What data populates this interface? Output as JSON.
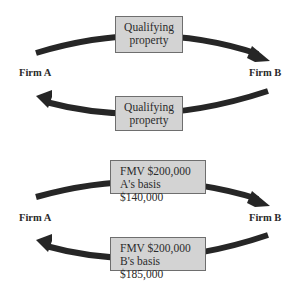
{
  "diagrams": [
    {
      "left_party": "Firm A",
      "right_party": "Firm B",
      "top_box": {
        "lines": [
          "Qualifying",
          "property"
        ]
      },
      "bottom_box": {
        "lines": [
          "Qualifying",
          "property"
        ]
      },
      "top_arrow_direction": "A to B",
      "bottom_arrow_direction": "B to A"
    },
    {
      "left_party": "Firm A",
      "right_party": "Firm B",
      "top_box": {
        "lines": [
          "FMV $200,000",
          "A's basis $140,000"
        ]
      },
      "bottom_box": {
        "lines": [
          "FMV $200,000",
          "B's basis $185,000"
        ]
      },
      "top_arrow_direction": "A to B",
      "bottom_arrow_direction": "B to A"
    }
  ],
  "colors": {
    "arrow": "#262626",
    "box_fill": "#d3d3d3",
    "box_border": "#6e6e6e",
    "text": "#2b2b2b"
  }
}
